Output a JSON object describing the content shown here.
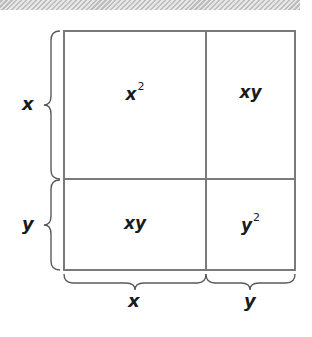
{
  "diagram": {
    "colors": {
      "line": "#7a7a7a",
      "text": "#1a1a1a",
      "brace": "#5a5a5a"
    },
    "cells": [
      {
        "id": "top-left",
        "base": "x",
        "exp": "2"
      },
      {
        "id": "top-right",
        "base": "xy",
        "exp": ""
      },
      {
        "id": "bottom-left",
        "base": "xy",
        "exp": ""
      },
      {
        "id": "bottom-right",
        "base": "y",
        "exp": "2"
      }
    ],
    "side_labels": {
      "left_top": "x",
      "left_bottom": "y",
      "bottom_left": "x",
      "bottom_right": "y"
    }
  }
}
